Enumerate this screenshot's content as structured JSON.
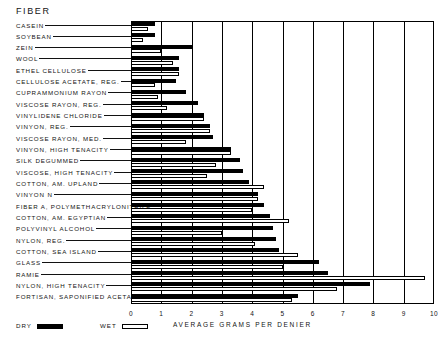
{
  "header": {
    "title": "FIBER"
  },
  "legend": {
    "dry_label": "DRY",
    "wet_label": "WET"
  },
  "chart_data": {
    "type": "bar",
    "orientation": "horizontal",
    "title": "FIBER",
    "xlabel": "AVERAGE GRAMS PER DENIER",
    "ylabel": "FIBER",
    "xlim": [
      0,
      10
    ],
    "xticks": [
      "0",
      "1",
      "2",
      "3",
      "4",
      "5",
      "6",
      "7",
      "8",
      "9",
      "10"
    ],
    "grid": "vertical-major",
    "legend_position": "bottom-left",
    "categories": [
      "CASEIN",
      "SOYBEAN",
      "ZEIN",
      "WOOL",
      "ETHEL CELLULOSE",
      "CELLULOSE ACETATE, REG.",
      "CUPRAMMONIUM RAYON",
      "VISCOSE RAYON, REG.",
      "VINYLIDENE CHLORIDE",
      "VINYON, REG.",
      "VISCOSE RAYON, MED.",
      "VINYON, HIGH TENACITY",
      "SILK DEGUMMED",
      "VISCOSE, HIGH TENACITY",
      "COTTON, AM. UPLAND",
      "VINYON  N",
      "FIBER A, POLYMETHACRYLONITRILE",
      "COTTON, AM. EGYPTIAN",
      "POLYVINYL ALCOHOL",
      "NYLON, REG.",
      "COTTON, SEA ISLAND",
      "GLASS",
      "RAMIE",
      "NYLON, HIGH TENACITY",
      "FORTISAN, SAPONIFIED ACETATE"
    ],
    "series": [
      {
        "name": "DRY",
        "color": "#000000",
        "values": [
          0.8,
          0.8,
          2.0,
          1.6,
          1.6,
          1.5,
          1.8,
          2.2,
          2.4,
          2.6,
          2.7,
          3.3,
          3.6,
          3.7,
          3.9,
          4.2,
          4.4,
          4.6,
          4.7,
          4.8,
          4.9,
          6.2,
          6.5,
          7.9,
          5.5
        ]
      },
      {
        "name": "WET",
        "color": "#ffffff",
        "values": [
          0.55,
          0.4,
          1.0,
          1.4,
          1.6,
          0.8,
          0.9,
          1.2,
          2.4,
          2.6,
          1.8,
          3.3,
          2.8,
          2.5,
          4.4,
          4.2,
          4.0,
          5.2,
          3.0,
          4.1,
          5.5,
          5.0,
          9.7,
          6.8,
          5.3
        ]
      }
    ]
  }
}
